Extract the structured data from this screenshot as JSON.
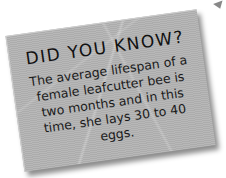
{
  "card": {
    "title": "DID YOU KNOW?",
    "body": "The average lifespan of a female leafcutter bee is two months and in this time, she lays 30 to 40 eggs."
  },
  "colors": {
    "card_background": "#b3b3b3",
    "text": "#161616",
    "page_background": "#ffffff"
  }
}
